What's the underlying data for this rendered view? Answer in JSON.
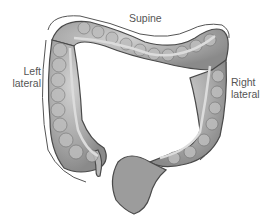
{
  "figure": {
    "labels": {
      "supine": "Supine",
      "left_line1": "Left",
      "left_line2": "lateral",
      "right_line1": "Right",
      "right_line2": "lateral"
    },
    "colors": {
      "background": "#ffffff",
      "colon_fill": "#a9a9a9",
      "colon_highlight": "#c8c8c8",
      "colon_outline": "#4a4a4a",
      "lumen_stripe": "#d9d9d9",
      "arc_line": "#555555",
      "label_text": "#555555"
    }
  }
}
